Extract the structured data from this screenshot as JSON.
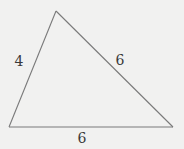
{
  "figure": {
    "type": "triangle",
    "vertices": {
      "top": [
        56,
        11
      ],
      "bottom_left": [
        9,
        127
      ],
      "bottom_right": [
        173,
        127
      ]
    },
    "stroke_color": "#7a7a7a",
    "background_color": "#f1f1f0",
    "side_labels": {
      "left": {
        "text": "4",
        "x": 19,
        "y": 61
      },
      "right": {
        "text": "6",
        "x": 120,
        "y": 60
      },
      "bottom": {
        "text": "6",
        "x": 82,
        "y": 138
      }
    }
  }
}
